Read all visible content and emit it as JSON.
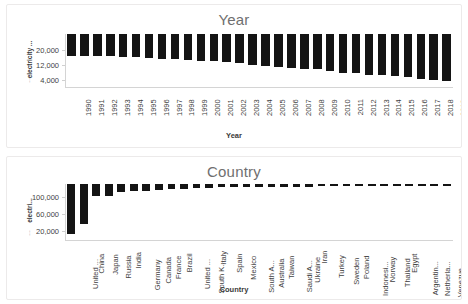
{
  "page": {
    "background": "#ffffff",
    "bar_color": "#141414",
    "card_border_color": "#eceaea",
    "title_color": "#6f6f6f"
  },
  "charts": [
    {
      "id": "year-chart",
      "title": "Year",
      "xlabel": "Year",
      "ylabel": "electricity ...",
      "y_unit_prefix": "…"
    },
    {
      "id": "country-chart",
      "title": "Country",
      "xlabel": "Country",
      "ylabel": "electri...",
      "y_unit_prefix": "…"
    }
  ],
  "chart_data": [
    {
      "type": "bar",
      "title": "Year",
      "xlabel": "Year",
      "ylabel": "electricity ...",
      "ylim": [
        0,
        29000
      ],
      "yticks": [
        "4,000",
        "12,000",
        "20,000"
      ],
      "ytick_values": [
        4000,
        12000,
        20000
      ],
      "grid": false,
      "legend": "none",
      "categories": [
        "1990",
        "1991",
        "1992",
        "1993",
        "1994",
        "1995",
        "1996",
        "1997",
        "1998",
        "1999",
        "2000",
        "2001",
        "2002",
        "2003",
        "2004",
        "2005",
        "2006",
        "2007",
        "2008",
        "2009",
        "2010",
        "2011",
        "2012",
        "2013",
        "2014",
        "2015",
        "2016",
        "2017",
        "2018",
        "2019"
      ],
      "values": [
        11900,
        12050,
        12050,
        12250,
        12600,
        12850,
        13150,
        13600,
        13850,
        14200,
        14800,
        15000,
        15300,
        16100,
        16800,
        17400,
        18100,
        18850,
        19300,
        19000,
        20500,
        21100,
        21600,
        22200,
        22700,
        23200,
        23800,
        24400,
        25400,
        25900
      ]
    },
    {
      "type": "bar",
      "title": "Country",
      "xlabel": "Country",
      "ylabel": "electri...",
      "ylim": [
        0,
        130000
      ],
      "yticks": [
        "20,000",
        "60,000",
        "100,000"
      ],
      "ytick_values": [
        20000,
        60000,
        100000
      ],
      "grid": false,
      "legend": "none",
      "categories": [
        "United ...",
        "China",
        "Japan",
        "Russia",
        "India",
        "Germany",
        "Canada",
        "France",
        "Brazil",
        "United ...",
        "South K...",
        "Italy",
        "Spain",
        "Mexico",
        "South A...",
        "Australia",
        "Taiwan",
        "Saudi A...",
        "Ukraine",
        "Iran",
        "Turkey",
        "Sweden",
        "Poland",
        "Indonesi...",
        "Norway",
        "Thailand",
        "Egypt",
        "Argentin...",
        "Netherla...",
        "Venezue...",
        "Malaysia"
      ],
      "values": [
        115000,
        92000,
        28000,
        27500,
        19000,
        15500,
        15500,
        14000,
        12000,
        10500,
        10000,
        8500,
        8000,
        7500,
        7200,
        7000,
        6800,
        6500,
        6200,
        6000,
        5800,
        5600,
        5400,
        5000,
        4800,
        4600,
        4400,
        4200,
        4000,
        3800,
        3600
      ]
    }
  ]
}
